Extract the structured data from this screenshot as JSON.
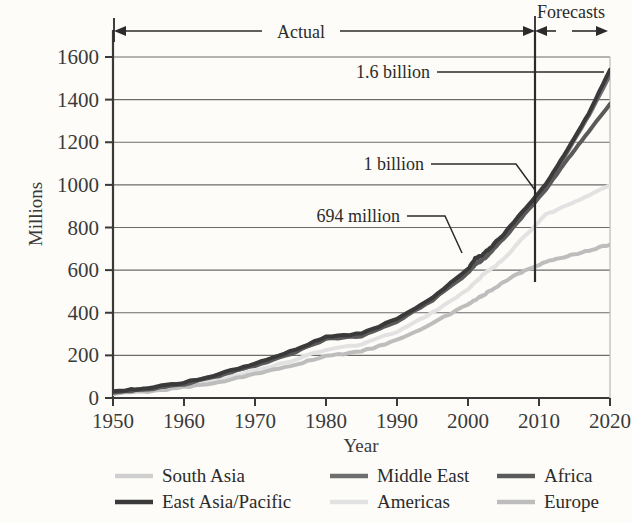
{
  "chart_data": {
    "type": "line",
    "title": "",
    "xlabel": "Year",
    "ylabel": "Millions",
    "xlim": [
      1950,
      2020
    ],
    "ylim": [
      0,
      1600
    ],
    "grid": true,
    "legend_position": "bottom",
    "xticks": [
      "1950",
      "1960",
      "1970",
      "1980",
      "1990",
      "2000",
      "2010",
      "2020"
    ],
    "xtick_values": [
      1950,
      1960,
      1970,
      1980,
      1990,
      2000,
      2010,
      2020
    ],
    "yticks": [
      "0",
      "200",
      "400",
      "600",
      "800",
      "1000",
      "1200",
      "1400",
      "1600"
    ],
    "ytick_values": [
      0,
      200,
      400,
      600,
      800,
      1000,
      1200,
      1400,
      1600
    ],
    "x": [
      1950,
      1955,
      1960,
      1965,
      1970,
      1975,
      1980,
      1985,
      1990,
      1995,
      2000,
      2001,
      2002,
      2003,
      2005,
      2008,
      2011,
      2014,
      2017,
      2020
    ],
    "series": [
      {
        "name": "South Asia",
        "color": "#cfcfcf",
        "width": 4,
        "values": [
          28,
          45,
          70,
          110,
          160,
          215,
          285,
          300,
          370,
          470,
          600,
          640,
          660,
          690,
          760,
          880,
          1000,
          1160,
          1330,
          1520
        ]
      },
      {
        "name": "East Asia/Pacific",
        "color": "#3a3a3a",
        "width": 4,
        "values": [
          30,
          48,
          72,
          112,
          162,
          218,
          288,
          302,
          372,
          472,
          605,
          655,
          672,
          700,
          768,
          885,
          1005,
          1165,
          1335,
          1540
        ]
      },
      {
        "name": "Middle East",
        "color": "#6e6e6e",
        "width": 4,
        "values": [
          26,
          43,
          68,
          108,
          158,
          212,
          282,
          298,
          366,
          466,
          596,
          636,
          656,
          686,
          756,
          875,
          995,
          1155,
          1325,
          1515
        ]
      },
      {
        "name": "Americas",
        "color": "#e2e2e2",
        "width": 4,
        "values": [
          24,
          38,
          58,
          88,
          128,
          172,
          228,
          250,
          312,
          400,
          510,
          540,
          575,
          600,
          650,
          760,
          860,
          905,
          950,
          1000
        ]
      },
      {
        "name": "Africa",
        "color": "#5a5a5a",
        "width": 4,
        "values": [
          25,
          41,
          65,
          104,
          152,
          206,
          276,
          292,
          358,
          458,
          586,
          626,
          646,
          676,
          746,
          862,
          980,
          1120,
          1250,
          1380
        ]
      },
      {
        "name": "Europe",
        "color": "#bdbdbd",
        "width": 4,
        "values": [
          20,
          32,
          50,
          76,
          112,
          150,
          198,
          218,
          272,
          350,
          440,
          460,
          480,
          500,
          545,
          600,
          640,
          665,
          692,
          720
        ]
      }
    ],
    "annotations": [
      {
        "text": "1.6 billion",
        "value": 1600,
        "points_to_year": 2020,
        "points_to_value": 1550
      },
      {
        "text": "1 billion",
        "value": 1000,
        "points_to_year": 2011,
        "points_to_value": 1000
      },
      {
        "text": "694 million",
        "value": 694,
        "points_to_year": 2002,
        "points_to_value": 694
      }
    ],
    "span_labels": [
      {
        "text": "Actual",
        "from": 1950,
        "to": 2011
      },
      {
        "text": "Forecasts",
        "from": 2011,
        "to": 2020
      }
    ],
    "forecast_divider_year": 2011
  },
  "axes": {
    "ylabel": "Millions",
    "xlabel": "Year",
    "xticks": [
      "1950",
      "1960",
      "1970",
      "1980",
      "1990",
      "2000",
      "2010",
      "2020"
    ],
    "yticks": [
      "1600",
      "1400",
      "1200",
      "1000",
      "800",
      "600",
      "400",
      "200",
      "0"
    ]
  },
  "annotations": {
    "a1": "1.6 billion",
    "a2": "1 billion",
    "a3": "694 million",
    "actual": "Actual",
    "forecasts": "Forecasts"
  },
  "legend": {
    "items": [
      {
        "label": "South Asia",
        "color": "#cfcfcf"
      },
      {
        "label": "Middle East",
        "color": "#6e6e6e"
      },
      {
        "label": "Africa",
        "color": "#5a5a5a"
      },
      {
        "label": "East Asia/Pacific",
        "color": "#3a3a3a"
      },
      {
        "label": "Americas",
        "color": "#e2e2e2"
      },
      {
        "label": "Europe",
        "color": "#bdbdbd"
      }
    ]
  }
}
